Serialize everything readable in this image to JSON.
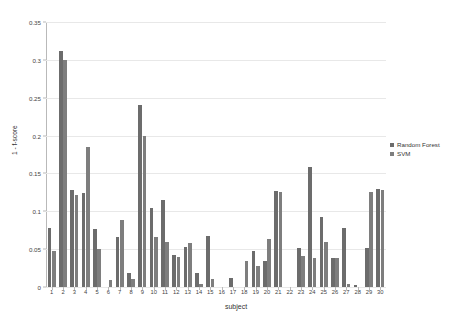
{
  "chart_data": {
    "type": "bar",
    "title": "",
    "xlabel": "subject",
    "ylabel": "1 - f-score",
    "grid": true,
    "legend_position": "right",
    "ylim": [
      0,
      0.35
    ],
    "yticks": [
      0,
      0.05,
      0.1,
      0.15,
      0.2,
      0.25,
      0.3,
      0.35
    ],
    "ytick_labels": [
      "0",
      "0.05",
      "0.1",
      "0.15",
      "0.2",
      "0.25",
      "0.3",
      "0.35"
    ],
    "categories": [
      "1",
      "2",
      "3",
      "4",
      "5",
      "6",
      "7",
      "8",
      "9",
      "10",
      "11",
      "12",
      "13",
      "14",
      "15",
      "16",
      "17",
      "18",
      "19",
      "20",
      "21",
      "22",
      "23",
      "24",
      "25",
      "26",
      "27",
      "28",
      "29",
      "30"
    ],
    "series": [
      {
        "name": "Random Forest",
        "color": "#6c6c6c",
        "values": [
          0.078,
          0.312,
          0.128,
          0.124,
          0.077,
          0.0,
          0.066,
          0.018,
          0.241,
          0.104,
          0.115,
          0.042,
          0.053,
          0.018,
          0.068,
          0.0,
          0.012,
          0.0,
          0.047,
          0.034,
          0.127,
          0.0,
          0.052,
          0.159,
          0.092,
          0.038,
          0.078,
          0.003,
          0.052,
          0.13
        ]
      },
      {
        "name": "SVM",
        "color": "#7e7e7e",
        "values": [
          0.048,
          0.3,
          0.122,
          0.185,
          0.05,
          0.009,
          0.088,
          0.011,
          0.2,
          0.066,
          0.06,
          0.04,
          0.058,
          0.004,
          0.011,
          0.0,
          0.0,
          0.035,
          0.028,
          0.063,
          0.125,
          0.0,
          0.041,
          0.038,
          0.06,
          0.038,
          0.004,
          0.0,
          0.125,
          0.128
        ]
      }
    ]
  },
  "legend": {
    "items": [
      {
        "label": "Random Forest"
      },
      {
        "label": "SVM"
      }
    ]
  }
}
